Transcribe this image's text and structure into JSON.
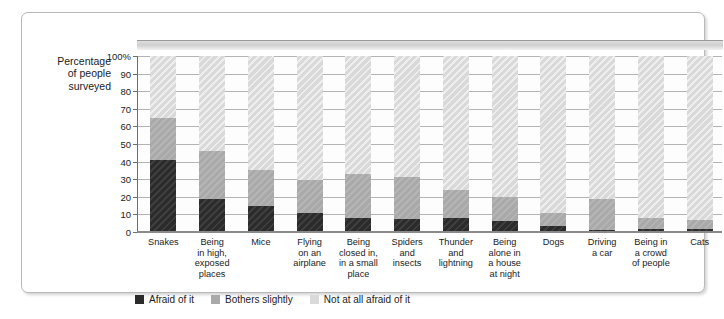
{
  "axis": {
    "y_title_lines": [
      "Percentage",
      "of people",
      "surveyed"
    ],
    "y_ticks": [
      "100%",
      "90",
      "80",
      "70",
      "60",
      "50",
      "40",
      "30",
      "20",
      "10",
      "0"
    ]
  },
  "legend": {
    "items": [
      {
        "label": "Afraid of it",
        "color": "#2b2b2b",
        "key": "afraid"
      },
      {
        "label": "Bothers slightly",
        "color": "#a9a9a9",
        "key": "slight"
      },
      {
        "label": "Not at all afraid of it",
        "color": "#d9d9d9",
        "key": "none"
      }
    ]
  },
  "chart_data": {
    "type": "bar",
    "title": "",
    "xlabel": "",
    "ylabel": "Percentage of people surveyed",
    "ylim": [
      0,
      100
    ],
    "grid": true,
    "stacked": true,
    "legend_position": "bottom-left",
    "ytick_labels": [
      "100%",
      "90",
      "80",
      "70",
      "60",
      "50",
      "40",
      "30",
      "20",
      "10",
      "0"
    ],
    "ytick_values": [
      100,
      90,
      80,
      70,
      60,
      50,
      40,
      30,
      20,
      10,
      0
    ],
    "categories": [
      "Snakes",
      "Being in high, exposed places",
      "Mice",
      "Flying on an airplane",
      "Being closed in, in a small place",
      "Spiders and insects",
      "Thunder and lightning",
      "Being alone in a house at night",
      "Dogs",
      "Driving a car",
      "Being in a crowd of people",
      "Cats"
    ],
    "category_label_lines": [
      [
        "Snakes"
      ],
      [
        "Being",
        "in high,",
        "exposed",
        "places"
      ],
      [
        "Mice"
      ],
      [
        "Flying",
        "on an",
        "airplane"
      ],
      [
        "Being",
        "closed in,",
        "in a small",
        "place"
      ],
      [
        "Spiders",
        "and",
        "insects"
      ],
      [
        "Thunder",
        "and",
        "lightning"
      ],
      [
        "Being",
        "alone in",
        "a house",
        "at night"
      ],
      [
        "Dogs"
      ],
      [
        "Driving",
        "a car"
      ],
      [
        "Being in",
        "a crowd",
        "of people"
      ],
      [
        "Cats"
      ]
    ],
    "series": [
      {
        "name": "Afraid of it",
        "color": "#2b2b2b",
        "values": [
          41,
          18.5,
          15,
          11,
          8,
          7.5,
          8,
          6,
          3.5,
          1,
          1.5,
          1.5
        ]
      },
      {
        "name": "Bothers slightly",
        "color": "#a9a9a9",
        "values": [
          24,
          27.5,
          20.5,
          18.5,
          25,
          23.5,
          16,
          14,
          7.5,
          17.5,
          6.5,
          5.5
        ]
      },
      {
        "name": "Not at all afraid of it",
        "color": "#d9d9d9",
        "values": [
          35,
          54,
          64.5,
          70.5,
          67,
          69,
          76,
          80,
          89,
          81.5,
          92,
          93
        ]
      }
    ],
    "cumulative_tops": {
      "afraid": [
        41,
        18.5,
        15,
        11,
        8,
        7.5,
        8,
        6,
        3.5,
        1,
        1.5,
        1.5
      ],
      "bothers": [
        65,
        46,
        35.5,
        29.5,
        33,
        31,
        24,
        20,
        11,
        18.5,
        8,
        7
      ]
    }
  }
}
